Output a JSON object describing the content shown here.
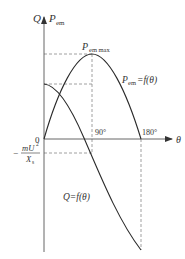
{
  "diagram": {
    "type": "power-angle characteristic",
    "axes": {
      "y_label_q": "Q",
      "y_label_p": "P",
      "y_label_p_sub": "em",
      "x_label": "θ",
      "origin_label": "0"
    },
    "ticks": {
      "x_90": "90°",
      "x_180": "180°"
    },
    "annotations": {
      "p_max_main": "P",
      "p_max_sub": "em max",
      "p_curve_main": "P",
      "p_curve_sub": "em",
      "p_curve_rest": "=f(θ)",
      "q_curve": "Q=f(θ)",
      "neg_sign": "−",
      "frac_num": "mU",
      "frac_num_sup": "2",
      "frac_den": "X",
      "frac_den_sub": "s"
    },
    "colors": {
      "curve": "#2a2a2a",
      "axis": "#555555",
      "dash": "#888888",
      "text": "#333333"
    }
  }
}
